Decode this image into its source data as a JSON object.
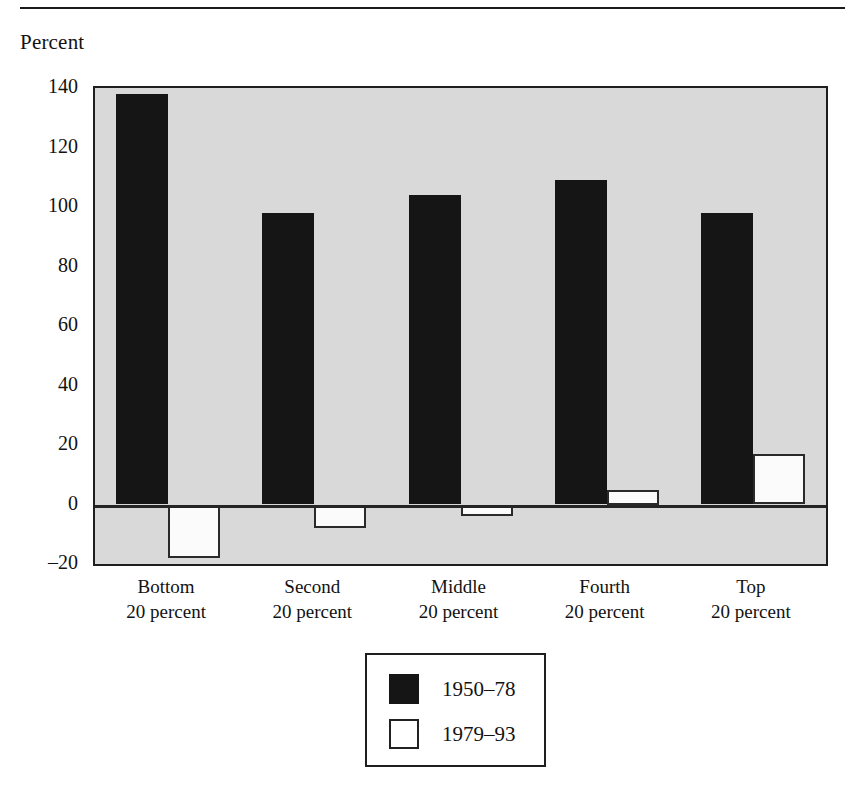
{
  "figure": {
    "axis_title": "Percent",
    "top_rule": "horizontal-rule"
  },
  "chart_data": {
    "type": "bar",
    "title": "",
    "subtitle": "",
    "xlabel": "",
    "ylabel": "Percent",
    "categories": [
      "Bottom\n20 percent",
      "Second\n20 percent",
      "Middle\n20 percent",
      "Fourth\n20 percent",
      "Top\n20 percent"
    ],
    "category_lines": [
      [
        "Bottom",
        "20 percent"
      ],
      [
        "Second",
        "20 percent"
      ],
      [
        "Middle",
        "20 percent"
      ],
      [
        "Fourth",
        "20 percent"
      ],
      [
        "Top",
        "20 percent"
      ]
    ],
    "series": [
      {
        "name": "1950–78",
        "color": "#151515",
        "values": [
          138,
          98,
          104,
          109,
          98
        ]
      },
      {
        "name": "1979–93",
        "color": "#ffffff",
        "values": [
          -18,
          -8,
          -4,
          5,
          17
        ]
      }
    ],
    "ylim": [
      -20,
      140
    ],
    "yticks": [
      140,
      120,
      100,
      80,
      60,
      40,
      20,
      0,
      -20
    ],
    "ytick_labels": [
      "140",
      "120",
      "100",
      "80",
      "60",
      "40",
      "20",
      "0",
      "–20"
    ],
    "grid": false,
    "zero_line": true,
    "legend_position": "bottom-center",
    "plot_background": "#d9d9d9",
    "frame_color": "#1f1f1f"
  },
  "legend": {
    "entries": [
      {
        "label": "1950–78",
        "swatch": "filled-black-swatch"
      },
      {
        "label": "1979–93",
        "swatch": "outlined-white-swatch"
      }
    ]
  }
}
